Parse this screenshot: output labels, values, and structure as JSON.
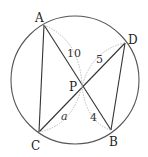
{
  "diagram": {
    "type": "intersecting-chords-in-circle",
    "circle": {
      "cx": 75,
      "cy": 80,
      "r": 64
    },
    "points": {
      "A": {
        "label": "A",
        "x": 44,
        "y": 25
      },
      "B": {
        "label": "B",
        "x": 111,
        "y": 130
      },
      "C": {
        "label": "C",
        "x": 39,
        "y": 132
      },
      "D": {
        "label": "D",
        "x": 125,
        "y": 43
      },
      "P": {
        "label": "P",
        "x": 82,
        "y": 86
      }
    },
    "segments": [
      {
        "from": "A",
        "to": "B"
      },
      {
        "from": "C",
        "to": "D"
      },
      {
        "from": "A",
        "to": "C"
      },
      {
        "from": "D",
        "to": "B"
      }
    ],
    "lengths": {
      "AP": "10",
      "PD": "5",
      "PB": "4",
      "PC": "a"
    }
  }
}
